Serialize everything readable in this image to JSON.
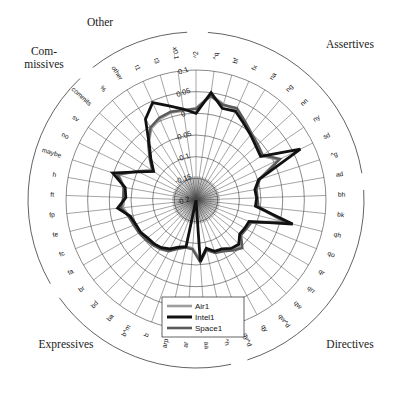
{
  "chart_data": {
    "type": "line",
    "subtype": "radar",
    "title": "",
    "xlabel": "",
    "ylabel": "",
    "rlim": [
      -0.2,
      0.1
    ],
    "r_tick_labels": [
      "0.1",
      "0.05",
      "0",
      "-0.05",
      "-0.1",
      "-0.15",
      "-0.2"
    ],
    "r_tick_values": [
      0.1,
      0.05,
      0,
      -0.05,
      -0.1,
      -0.15,
      -0.2
    ],
    "r_axis_multiplier_label": "x0.1",
    "grid": true,
    "legend_position": "bottom-center",
    "group_labels": [
      "Other",
      "Assertives",
      "Directives",
      "Expressives",
      "Commissives"
    ],
    "group_label_commissives_line1": "Com-",
    "group_label_commissives_line2": "missives",
    "categories": [
      "^2",
      "^q",
      "bf",
      "fx",
      "na",
      "ng",
      "nn",
      "ny",
      "sd",
      "^g",
      "ad",
      "bh",
      "bk",
      "qh",
      "qo",
      "qr",
      "qrr",
      "qw",
      "qw^d",
      "qy",
      "qy^d",
      "^h",
      "aa",
      "ar",
      "arp",
      "b",
      "b^m",
      "ba",
      "bd",
      "br",
      "fa",
      "fc",
      "fe",
      "fp",
      "ft",
      "h",
      "maybe",
      "no",
      "sv",
      "commits",
      "%",
      "other",
      "t1",
      "t3",
      "x0.1"
    ],
    "series": [
      {
        "name": "Air1",
        "color": "#9d9d9d",
        "width": 2.6,
        "values": [
          0.012,
          0.045,
          0.03,
          0.028,
          0.01,
          -0.002,
          -0.01,
          -0.018,
          0.012,
          -0.048,
          -0.06,
          -0.06,
          -0.058,
          0.01,
          -0.065,
          -0.068,
          -0.07,
          -0.05,
          -0.06,
          -0.07,
          -0.072,
          -0.085,
          -0.06,
          -0.088,
          -0.09,
          -0.082,
          -0.068,
          -0.062,
          -0.058,
          -0.055,
          -0.05,
          -0.048,
          -0.042,
          -0.03,
          -0.035,
          -0.032,
          -0.012,
          -0.05,
          -0.08,
          -0.058,
          -0.03,
          -0.005,
          0.005,
          0.01,
          0.008
        ]
      },
      {
        "name": "Space1",
        "color": "#5a5a5a",
        "width": 2.4,
        "values": [
          0.01,
          0.042,
          0.028,
          0.032,
          0.014,
          0.0,
          -0.008,
          -0.014,
          0.016,
          -0.045,
          -0.058,
          -0.058,
          -0.055,
          0.016,
          -0.062,
          -0.066,
          -0.068,
          -0.046,
          -0.056,
          -0.066,
          -0.07,
          -0.082,
          -0.056,
          -0.086,
          -0.088,
          -0.08,
          -0.066,
          -0.06,
          -0.056,
          -0.052,
          -0.048,
          -0.045,
          -0.04,
          -0.026,
          -0.032,
          -0.03,
          -0.01,
          -0.048,
          -0.078,
          -0.056,
          -0.028,
          -0.002,
          0.008,
          0.012,
          0.01
        ]
      },
      {
        "name": "Intel1",
        "color": "#111111",
        "width": 2.8,
        "values": [
          0.0,
          0.05,
          0.02,
          0.024,
          0.008,
          -0.004,
          -0.014,
          -0.02,
          0.068,
          -0.048,
          -0.062,
          -0.06,
          -0.062,
          0.03,
          -0.068,
          -0.07,
          -0.072,
          -0.058,
          -0.062,
          -0.072,
          -0.074,
          -0.086,
          -0.058,
          -0.2,
          -0.09,
          -0.084,
          -0.072,
          -0.064,
          -0.06,
          -0.058,
          -0.052,
          -0.05,
          -0.044,
          -0.018,
          -0.038,
          -0.034,
          0.002,
          -0.052,
          -0.082,
          -0.06,
          -0.032,
          0.02,
          0.046,
          0.026,
          0.012
        ]
      }
    ]
  },
  "legend": {
    "items": [
      {
        "label": "Air1",
        "color": "#9d9d9d"
      },
      {
        "label": "Intel1",
        "color": "#111111"
      },
      {
        "label": "Space1",
        "color": "#5a5a5a"
      }
    ]
  }
}
